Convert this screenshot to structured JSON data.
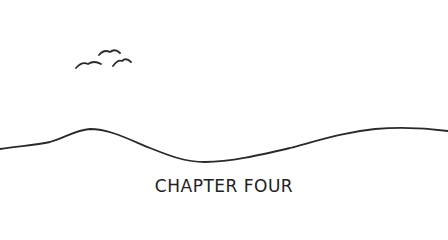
{
  "illustration": {
    "description": "Hand-drawn rolling hill line with three birds in the sky",
    "line_color": "#2a2a2a",
    "background": "#ffffff"
  },
  "chapter": {
    "title": "CHAPTER FOUR"
  }
}
